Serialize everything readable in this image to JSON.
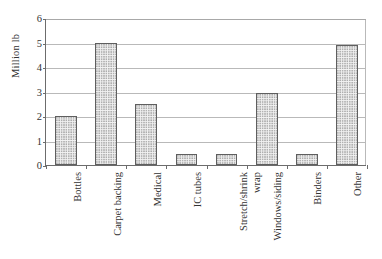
{
  "chart_data": {
    "type": "bar",
    "title": "",
    "subtitle": "",
    "xlabel": "",
    "ylabel": "Million lb",
    "ylim": [
      0,
      6
    ],
    "yticks": [
      0,
      1,
      2,
      3,
      4,
      5,
      6
    ],
    "ytick_labels": [
      "0",
      "1",
      "2",
      "3",
      "4",
      "5",
      "6"
    ],
    "grid": true,
    "grid_axis": "y",
    "legend": false,
    "legend_position": "none",
    "orientation": "vertical",
    "categories": [
      "Bottles",
      "Carpet backing",
      "Medical",
      "Stretch/shrink wrap",
      "IC tubes",
      "Windows/siding",
      "Binders",
      "Other"
    ],
    "category_labels": [
      {
        "line1": "Bottles",
        "line2": ""
      },
      {
        "line1": "Carpet backing",
        "line2": ""
      },
      {
        "line1": "Medical",
        "line2": ""
      },
      {
        "line1": "IC tubes",
        "line2": ""
      },
      {
        "line1": "Stretch/shrink",
        "line2": "wrap"
      },
      {
        "line1": "Windows/siding",
        "line2": ""
      },
      {
        "line1": "Binders",
        "line2": ""
      },
      {
        "line1": "Other",
        "line2": ""
      }
    ],
    "values": [
      2.0,
      5.0,
      2.5,
      0.45,
      0.45,
      2.95,
      0.43,
      4.9
    ],
    "series": [
      {
        "name": "Million lb",
        "values": [
          2.0,
          5.0,
          2.5,
          0.45,
          0.45,
          2.95,
          0.43,
          4.9
        ]
      }
    ],
    "bar_fill": "#f2f2f2",
    "bar_pattern": "fine-dotted",
    "bar_edge_color": "#5f5f5f",
    "grid_color": "#b9b9b9",
    "axis_color": "#6c6c6c",
    "text_color": "#333333",
    "background": "#ffffff"
  }
}
